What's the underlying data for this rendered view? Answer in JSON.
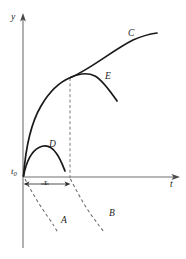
{
  "figure": {
    "name": "creep-recovery-strain-time-diagram",
    "background_color": "#ffffff",
    "width": 186,
    "height": 259,
    "axes": {
      "y_axis": {
        "label": "y",
        "icon": "arrow-up-icon",
        "x": 23,
        "top": 15,
        "bottom": 248,
        "color": "#707070"
      },
      "x_axis": {
        "label": "t",
        "icon": "arrow-right-icon",
        "y": 177,
        "left": 23,
        "right": 178,
        "color": "#707070"
      },
      "origin_label": "t",
      "origin_subscript": "0"
    },
    "dimension": {
      "name": "tau-interval",
      "label": "τ",
      "from_x": 24,
      "to_x": 70,
      "y": 184,
      "color": "#3c3c3c"
    },
    "guide": {
      "name": "vertical-dashed-guide",
      "x": 70,
      "top": 78,
      "bottom": 179,
      "color": "#7a7a7a"
    },
    "curves": [
      {
        "id": "C",
        "label": "C",
        "style": "solid",
        "color": "#1a1a1a",
        "description": "primary rising concave-down creep curve from origin to upper right",
        "path": "M 23.5 176 C 25.5 150 31 123 41 106 C 52 87 62 81 70.5 77.5 C 90 69.5 113 50 133 40 C 143 35.5 150 34 157 33"
      },
      {
        "id": "E",
        "label": "E",
        "style": "solid",
        "color": "#1a1a1a",
        "description": "recovery branch descending from the knee at tau to the right",
        "path": "M 70.5 77.5 C 79 73.5 88 72.5 95 76 C 103 80.5 110 91 117 101"
      },
      {
        "id": "D",
        "label": "D",
        "style": "solid",
        "color": "#1a1a1a",
        "description": "lower small rise-and-fall curve ending before tau",
        "path": "M 23.5 176 C 26.5 161 32 151 39 147.5 C 46 144 52 147 56.5 153.5 C 60.5 159 63 166 65 171"
      },
      {
        "id": "A",
        "label": "A",
        "style": "dashed",
        "color": "#6b6b6b",
        "description": "dashed continuation below the t-axis starting at t0",
        "path": "M 25 179 C 31 191 40 206 48 217 C 53 224 56 229 58 233"
      },
      {
        "id": "B",
        "label": "B",
        "style": "dashed",
        "color": "#6b6b6b",
        "description": "dashed continuation below the t-axis starting at t0 plus tau",
        "path": "M 70.5 179 C 76 190 84 205 92 216 C 97 223 101 228 104 232"
      }
    ],
    "labels": {
      "y": "y",
      "t": "t",
      "tau": "τ",
      "C": "C",
      "E": "E",
      "D": "D",
      "A": "A",
      "B": "B"
    }
  }
}
